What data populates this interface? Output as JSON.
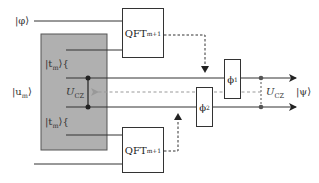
{
  "diagram": {
    "type": "quantum-circuit",
    "inputs": {
      "phi": "|φ⟩",
      "u_m": "|u",
      "u_m_sub": "m",
      "t_m_top": "|t",
      "t_m_top_sub": "m",
      "t_m_bottom": "|t",
      "t_m_bottom_sub": "m"
    },
    "output": "|ψ⟩",
    "gates": {
      "qft_top": {
        "label": "QFT",
        "sub": "m+1"
      },
      "qft_bottom": {
        "label": "QFT",
        "sub": "m+1"
      },
      "phi1": {
        "label": "ϕ",
        "sub": "1"
      },
      "phi2": {
        "label": "ϕ",
        "sub": "2"
      },
      "ucz_inner": {
        "label": "U",
        "sub": "CZ"
      },
      "ucz_outer": {
        "label": "U",
        "sub": "CZ"
      }
    },
    "colors": {
      "line": "#333333",
      "shaded_region": "#b0b0b0",
      "shaded_border": "#555555",
      "dashed_gray": "#999999"
    }
  }
}
